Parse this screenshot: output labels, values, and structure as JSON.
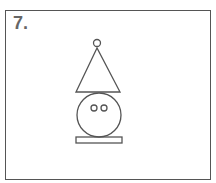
{
  "figure": {
    "label": "7.",
    "stroke_color": "#555555",
    "shapes": [
      {
        "name": "small-circle",
        "type": "circle",
        "cx": 97,
        "cy": 43,
        "r": 3.5
      },
      {
        "name": "triangle",
        "type": "triangle",
        "points": [
          [
            97,
            48
          ],
          [
            76,
            92
          ],
          [
            120,
            92
          ]
        ]
      },
      {
        "name": "large-circle",
        "type": "circle",
        "cx": 99,
        "cy": 115,
        "r": 22
      },
      {
        "name": "left-eye",
        "type": "circle",
        "cx": 94,
        "cy": 108,
        "r": 3
      },
      {
        "name": "right-eye",
        "type": "circle",
        "cx": 104,
        "cy": 108,
        "r": 3
      },
      {
        "name": "base-rectangle",
        "type": "rect",
        "x": 76,
        "y": 137,
        "w": 46,
        "h": 6
      }
    ]
  }
}
